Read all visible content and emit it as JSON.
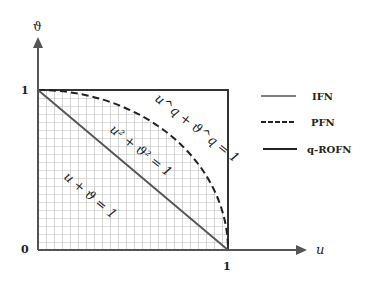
{
  "diagram": {
    "y_axis_label": "ϑ",
    "x_axis_label": "u",
    "tick_y_top": "1",
    "tick_origin": "0",
    "tick_x_right": "1",
    "curve_labels": {
      "q_rofn": "u^q + ϑ^q = 1",
      "pfn": "u² + ϑ² = 1",
      "ifn": "u + ϑ = 1"
    },
    "legend": [
      {
        "label": "IFN",
        "style": "solid"
      },
      {
        "label": "PFN",
        "style": "dashed"
      },
      {
        "label": "q-ROFN",
        "style": "solid"
      }
    ],
    "colors": {
      "line": "#333333",
      "grid": "#bbbbbb"
    }
  }
}
